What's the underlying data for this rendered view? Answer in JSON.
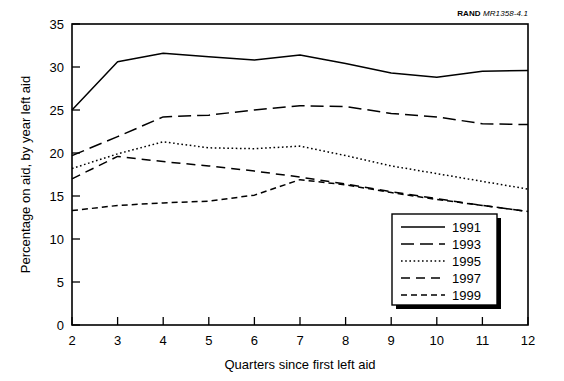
{
  "credit": {
    "organization": "RAND",
    "document_id": "MR1358-4.1"
  },
  "chart_data": {
    "type": "line",
    "title": "",
    "xlabel": "Quarters since first left aid",
    "ylabel": "Percentage on aid, by year left aid",
    "x": [
      2,
      3,
      4,
      5,
      6,
      7,
      8,
      9,
      10,
      11,
      12
    ],
    "xlim": [
      2,
      12
    ],
    "ylim": [
      0,
      35
    ],
    "xticks": [
      "2",
      "3",
      "4",
      "5",
      "6",
      "7",
      "8",
      "9",
      "10",
      "11",
      "12"
    ],
    "yticks": [
      "0",
      "5",
      "10",
      "15",
      "20",
      "25",
      "30",
      "35"
    ],
    "grid": false,
    "legend_position": "lower-right-inside",
    "series": [
      {
        "name": "1991",
        "style": "solid",
        "values": [
          25.0,
          30.6,
          31.6,
          31.2,
          30.8,
          31.4,
          30.4,
          29.3,
          28.8,
          29.5,
          29.6
        ]
      },
      {
        "name": "1993",
        "style": "long-dash",
        "values": [
          19.7,
          21.9,
          24.2,
          24.4,
          25.0,
          25.5,
          25.4,
          24.6,
          24.2,
          23.4,
          23.3
        ]
      },
      {
        "name": "1995",
        "style": "dotted",
        "values": [
          18.2,
          19.9,
          21.3,
          20.6,
          20.5,
          20.8,
          19.7,
          18.5,
          17.6,
          16.7,
          15.8
        ]
      },
      {
        "name": "1997",
        "style": "dash",
        "values": [
          17.0,
          19.6,
          19.0,
          18.5,
          17.9,
          17.2,
          16.4,
          15.5,
          14.7,
          13.9,
          13.2
        ]
      },
      {
        "name": "1999",
        "style": "short-dash",
        "values": [
          13.3,
          13.9,
          14.2,
          14.4,
          15.1,
          16.9,
          16.3,
          15.4,
          14.6,
          13.9,
          13.2
        ]
      }
    ]
  }
}
